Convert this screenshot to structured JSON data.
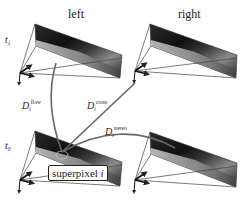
{
  "columns": {
    "left": "left",
    "right": "right"
  },
  "rows": {
    "t1": {
      "symbol": "t",
      "sub": "1"
    },
    "t0": {
      "symbol": "t",
      "sub": "0"
    }
  },
  "edges": {
    "flow": {
      "symbol": "D",
      "sub": "i",
      "sup": "flow"
    },
    "cross": {
      "symbol": "D",
      "sub": "i",
      "sup": "cross"
    },
    "stereo": {
      "symbol": "D",
      "sub": "i",
      "sup": "stereo"
    }
  },
  "superpixel": {
    "label": "superpixel",
    "index": "i"
  },
  "colors": {
    "line": "#555555",
    "curve": "#666666",
    "frame_dark": "#1a1a1a",
    "text": "#222222"
  }
}
